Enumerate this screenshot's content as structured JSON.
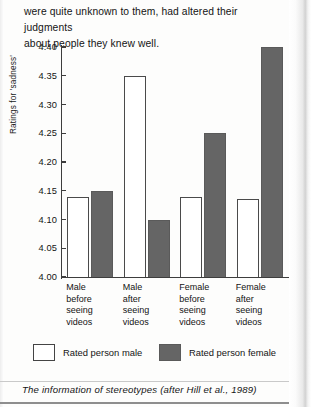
{
  "document": {
    "body_text_lines": [
      "were quite unknown to them, had altered their judgments",
      "about people they knew well."
    ],
    "caption": "The information of stereotypes (after Hill et al., 1989)"
  },
  "chart_data": {
    "type": "bar",
    "title": "",
    "xlabel": "",
    "ylabel": "Ratings for 'sadness'",
    "ylim": [
      4.0,
      4.4
    ],
    "ytick_labels": [
      "4.40",
      "4.35",
      "4.30",
      "4.25",
      "4.20",
      "4.15",
      "4.10",
      "4.05",
      "4.00"
    ],
    "ytick_values": [
      4.4,
      4.35,
      4.3,
      4.25,
      4.2,
      4.15,
      4.1,
      4.05,
      4.0
    ],
    "grid": false,
    "legend_position": "bottom",
    "categories": [
      "Male before seeing videos",
      "Male after seeing videos",
      "Female before seeing videos",
      "Female after seeing videos"
    ],
    "category_label_lines": [
      [
        "Male",
        "before",
        "seeing",
        "videos"
      ],
      [
        "Male",
        "after",
        "seeing",
        "videos"
      ],
      [
        "Female",
        "before",
        "seeing",
        "videos"
      ],
      [
        "Female",
        "after",
        "seeing",
        "videos"
      ]
    ],
    "series": [
      {
        "name": "Rated person male",
        "color": "#ffffff",
        "values": [
          4.14,
          4.35,
          4.14,
          4.135
        ]
      },
      {
        "name": "Rated person female",
        "color": "#656565",
        "values": [
          4.15,
          4.1,
          4.25,
          4.4
        ]
      }
    ]
  },
  "legend": {
    "items": [
      {
        "label": "Rated person male",
        "style": "light"
      },
      {
        "label": "Rated person female",
        "style": "dark"
      }
    ]
  },
  "colors": {
    "dark_bar": "#656565",
    "light_bar": "#ffffff",
    "axis": "#3d3d3d",
    "text": "#141414"
  }
}
